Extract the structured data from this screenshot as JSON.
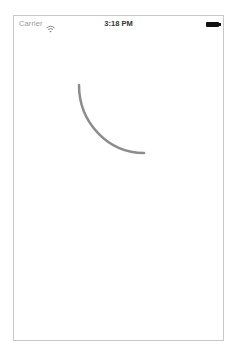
{
  "status_bar": {
    "carrier": "Carrier",
    "wifi_icon": "wifi-icon",
    "time": "3:18 PM",
    "battery_icon": "battery-icon"
  },
  "content": {
    "activity_indicator": {
      "type": "arc-spinner",
      "color": "#8c8c8c",
      "stroke_width": 2.5,
      "sweep_degrees": 90
    }
  }
}
